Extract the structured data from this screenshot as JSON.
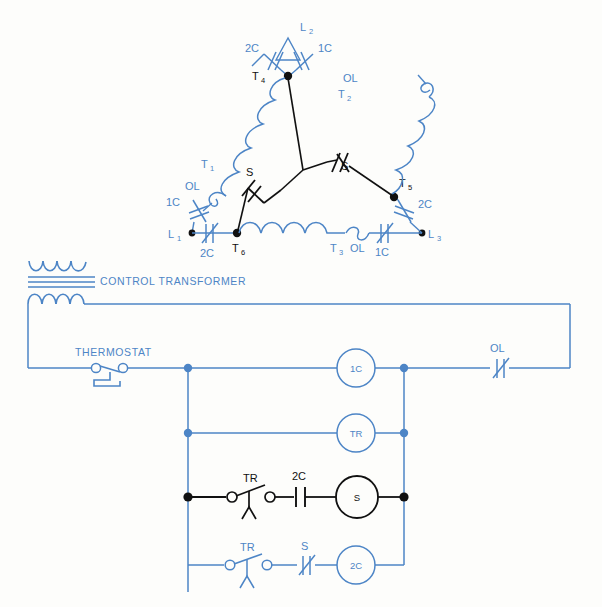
{
  "colors": {
    "blue": "#4d85c6",
    "blue_light": "#5f95d1",
    "black": "#1a1a1a",
    "background": "#fdfdfb"
  },
  "motor_delta": {
    "name": "delta-connected motor winding diagram",
    "line_terminals": [
      {
        "id": "L1",
        "label": "L",
        "sub": "1"
      },
      {
        "id": "L2",
        "label": "L",
        "sub": "2"
      },
      {
        "id": "L3",
        "label": "L",
        "sub": "3"
      }
    ],
    "winding_terminals": [
      {
        "id": "T1",
        "label": "T",
        "sub": "1"
      },
      {
        "id": "T2",
        "label": "T",
        "sub": "2"
      },
      {
        "id": "T3",
        "label": "T",
        "sub": "3"
      },
      {
        "id": "T4",
        "label": "T",
        "sub": "4"
      },
      {
        "id": "T5",
        "label": "T",
        "sub": "5"
      },
      {
        "id": "T6",
        "label": "T",
        "sub": "6"
      }
    ],
    "contacts": [
      {
        "id": "top-left-2C",
        "label": "2C"
      },
      {
        "id": "top-right-1C",
        "label": "1C"
      },
      {
        "id": "left-1C",
        "label": "1C"
      },
      {
        "id": "left-2C",
        "label": "2C"
      },
      {
        "id": "right-2C",
        "label": "2C"
      },
      {
        "id": "right-1C",
        "label": "1C"
      }
    ],
    "overloads": [
      {
        "id": "ol-left",
        "label": "OL"
      },
      {
        "id": "ol-right",
        "label": "OL"
      },
      {
        "id": "ol-bottom",
        "label": "OL"
      }
    ],
    "star_contacts": [
      {
        "id": "s-left",
        "label": "S"
      },
      {
        "id": "s-right",
        "label": "S"
      }
    ]
  },
  "control_circuit": {
    "transformer_label": "CONTROL TRANSFORMER",
    "rungs": [
      {
        "id": "rung-1c",
        "switch": {
          "name": "thermostat",
          "label": "THERMOSTAT"
        },
        "coil": "1C",
        "series_contact": "OL",
        "color": "blue"
      },
      {
        "id": "rung-tr",
        "coil": "TR",
        "color": "blue"
      },
      {
        "id": "rung-s",
        "timer_contact": "TR",
        "series_contact": "2C",
        "coil": "S",
        "color": "black"
      },
      {
        "id": "rung-2c",
        "timer_contact": "TR",
        "series_contact": "S",
        "coil": "2C",
        "color": "blue"
      }
    ]
  }
}
